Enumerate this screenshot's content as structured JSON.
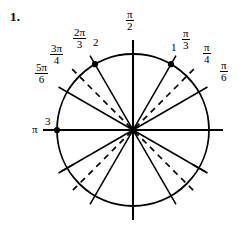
{
  "figure": {
    "problem_number": "1.",
    "ink_color": "#000000",
    "background_color": "#ffffff"
  },
  "geometry": {
    "center_x": 133,
    "center_y": 130,
    "radius": 76,
    "axis_overhang": 14
  },
  "labels": {
    "pi_over_2": {
      "numerator": "π",
      "denominator": "2"
    },
    "pi_over_3": {
      "numerator": "π",
      "denominator": "3"
    },
    "pi_over_4": {
      "numerator": "π",
      "denominator": "4"
    },
    "pi_over_6": {
      "numerator": "π",
      "denominator": "6"
    },
    "two_pi_over_3": {
      "numerator": "2π",
      "denominator": "3"
    },
    "three_pi_over_4": {
      "numerator": "3π",
      "denominator": "4"
    },
    "five_pi_over_6": {
      "numerator": "5π",
      "denominator": "6"
    },
    "pi": "π"
  },
  "point_indices": {
    "point_1": "1",
    "point_2": "2",
    "point_3": "3"
  },
  "chart_data": {
    "type": "scatter",
    "xlabel": "",
    "ylabel": "",
    "xlim": [
      -1.2,
      1.2
    ],
    "ylim": [
      -1.2,
      1.2
    ],
    "grid": false,
    "legend": "none",
    "circle": {
      "center": [
        0,
        0
      ],
      "radius": 1,
      "stroke": "#000000",
      "stroke_width": 1.8
    },
    "axes": [
      {
        "name": "x-axis",
        "from": [
          -1.18,
          0
        ],
        "to": [
          1.18,
          0
        ],
        "style": "solid"
      },
      {
        "name": "y-axis",
        "from": [
          0,
          -1.18
        ],
        "to": [
          0,
          1.18
        ],
        "style": "solid"
      }
    ],
    "radial_lines": [
      {
        "label": "π/6",
        "angle_deg": 30,
        "angle_rad": 0.5236,
        "style": "solid",
        "diameter": true
      },
      {
        "label": "π/4",
        "angle_deg": 45,
        "angle_rad": 0.7854,
        "style": "dashed",
        "diameter": true
      },
      {
        "label": "π/3",
        "angle_deg": 60,
        "angle_rad": 1.0472,
        "style": "solid",
        "diameter": true
      },
      {
        "label": "π/2",
        "angle_deg": 90,
        "angle_rad": 1.5708,
        "style": "solid",
        "diameter": true
      },
      {
        "label": "2π/3",
        "angle_deg": 120,
        "angle_rad": 2.0944,
        "style": "solid",
        "diameter": true
      },
      {
        "label": "3π/4",
        "angle_deg": 135,
        "angle_rad": 2.3562,
        "style": "dashed",
        "diameter": true
      },
      {
        "label": "5π/6",
        "angle_deg": 150,
        "angle_rad": 2.618,
        "style": "solid",
        "diameter": true
      },
      {
        "label": "π",
        "angle_deg": 180,
        "angle_rad": 3.1416,
        "style": "solid",
        "diameter": true
      }
    ],
    "marked_points": [
      {
        "index": "1",
        "angle_deg": 60,
        "angle_rad": 1.0472,
        "coords": [
          0.5,
          0.866
        ],
        "marker": "filled-circle"
      },
      {
        "index": "2",
        "angle_deg": 120,
        "angle_rad": 2.0944,
        "coords": [
          -0.5,
          0.866
        ],
        "marker": "filled-circle"
      },
      {
        "index": "3",
        "angle_deg": 180,
        "angle_rad": 3.1416,
        "coords": [
          -1.0,
          0.0
        ],
        "marker": "filled-circle"
      }
    ],
    "tick_marks": [
      {
        "angle_deg": 210,
        "angle_rad": 3.6652,
        "note": "short tick crossing circle"
      },
      {
        "angle_deg": 330,
        "angle_rad": 5.7596,
        "note": "short tick crossing circle"
      }
    ],
    "label_positions": [
      {
        "text": "π/2",
        "angle_deg": 90,
        "placement": "above-top"
      },
      {
        "text": "π/3",
        "angle_deg": 60,
        "placement": "outside"
      },
      {
        "text": "π/4",
        "angle_deg": 45,
        "placement": "outside"
      },
      {
        "text": "π/6",
        "angle_deg": 30,
        "placement": "outside"
      },
      {
        "text": "2π/3",
        "angle_deg": 120,
        "placement": "outside"
      },
      {
        "text": "3π/4",
        "angle_deg": 135,
        "placement": "outside"
      },
      {
        "text": "5π/6",
        "angle_deg": 150,
        "placement": "outside"
      },
      {
        "text": "π",
        "angle_deg": 180,
        "placement": "outside-left"
      }
    ]
  }
}
